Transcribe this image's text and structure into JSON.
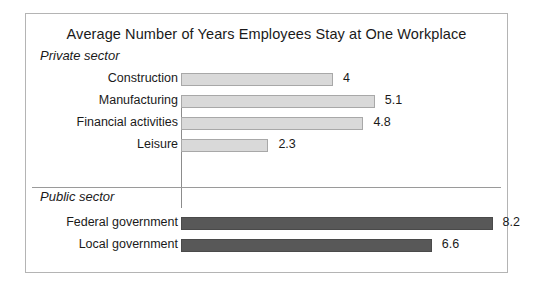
{
  "chart": {
    "title": "Average Number of Years Employees Stay at One Workplace",
    "sections": [
      {
        "heading": "Private sector",
        "bar_style": "light",
        "rows": [
          {
            "label": "Construction",
            "value": 4,
            "value_label": "4"
          },
          {
            "label": "Manufacturing",
            "value": 5.1,
            "value_label": "5.1"
          },
          {
            "label": "Financial activities",
            "value": 4.8,
            "value_label": "4.8"
          },
          {
            "label": "Leisure",
            "value": 2.3,
            "value_label": "2.3"
          }
        ]
      },
      {
        "heading": "Public sector",
        "bar_style": "dark",
        "rows": [
          {
            "label": "Federal government",
            "value": 8.2,
            "value_label": "8.2"
          },
          {
            "label": "Local government",
            "value": 6.6,
            "value_label": "6.6"
          }
        ]
      }
    ],
    "colors": {
      "private_bar_fill": "#d9d9d9",
      "private_bar_border": "#a8a8a8",
      "public_bar_fill": "#585858",
      "public_bar_border": "#4a4a4a",
      "frame_border": "#b4b4b4",
      "axis_line": "#8c8c8c",
      "divider": "#9a9a9a",
      "background": "#ffffff",
      "text": "#1a1a1a"
    }
  },
  "chart_data": {
    "type": "bar",
    "orientation": "horizontal",
    "title": "Average Number of Years Employees Stay at One Workplace",
    "xlabel": "",
    "ylabel": "",
    "xlim": [
      0,
      9
    ],
    "grid": false,
    "legend": "none",
    "groups": [
      {
        "name": "Private sector",
        "categories": [
          "Construction",
          "Manufacturing",
          "Financial activities",
          "Leisure"
        ],
        "values": [
          4,
          5.1,
          4.8,
          2.3
        ]
      },
      {
        "name": "Public sector",
        "categories": [
          "Federal government",
          "Local government"
        ],
        "values": [
          8.2,
          6.6
        ]
      }
    ],
    "categories": [
      "Construction",
      "Manufacturing",
      "Financial activities",
      "Leisure",
      "Federal government",
      "Local government"
    ],
    "values": [
      4,
      5.1,
      4.8,
      2.3,
      8.2,
      6.6
    ],
    "data_labels": [
      "4",
      "5.1",
      "4.8",
      "2.3",
      "8.2",
      "6.6"
    ]
  }
}
